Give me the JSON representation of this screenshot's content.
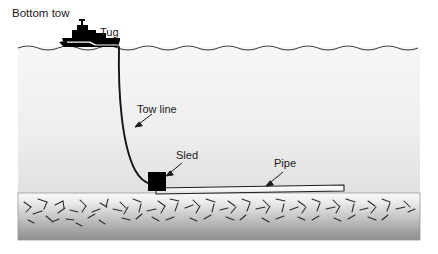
{
  "figure": {
    "title": "Bottom tow",
    "labels": {
      "tug": "Tug",
      "tow_line": "Tow line",
      "sled": "Sled",
      "pipe": "Pipe"
    },
    "colors": {
      "ink": "#1a1a1a",
      "water_top": "#f4f4f4",
      "water_bottom": "#e2e2e2",
      "seabed_top": "#f2f2f2",
      "seabed_bottom": "#8e8e8e",
      "sled_fill": "#000000",
      "pipe_fill": "#fbfbfb",
      "background": "#ffffff"
    },
    "scene": {
      "water_surface_label": "water surface",
      "seabed_label": "seabed",
      "vessel_label": "tug-boat"
    }
  }
}
